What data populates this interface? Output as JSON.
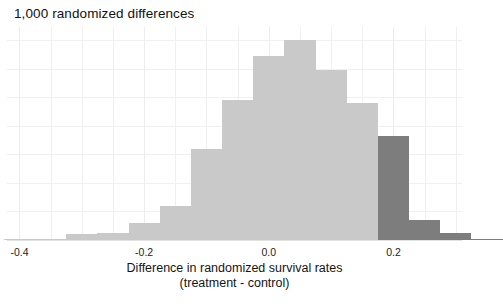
{
  "chart_data": {
    "type": "bar",
    "title": "1,000 randomized differences",
    "subtitle": "",
    "xlabel": "Difference in randomized survival rates",
    "xlabel_line2": "(treatment - control)",
    "ylabel": "",
    "xlim": [
      -0.42,
      0.31
    ],
    "ylim": [
      0,
      150
    ],
    "grid": true,
    "legend": null,
    "xticks": [
      -0.4,
      -0.2,
      0.0,
      0.2
    ],
    "xtick_labels": [
      "-0.4",
      "-0.2",
      "0.0",
      "0.2"
    ],
    "bin_width": 0.05,
    "colors": {
      "bar_light": "#c9c9c9",
      "bar_dark": "#7d7d7d",
      "grid": "#f0f0f0",
      "axis": "#e2e2e2",
      "text": "#1a1a1a"
    },
    "bins": [
      {
        "left": -0.425,
        "right": -0.375,
        "count": 1,
        "highlighted": false
      },
      {
        "left": -0.375,
        "right": -0.325,
        "count": 1,
        "highlighted": false
      },
      {
        "left": -0.325,
        "right": -0.275,
        "count": 4,
        "highlighted": false
      },
      {
        "left": -0.275,
        "right": -0.225,
        "count": 5,
        "highlighted": false
      },
      {
        "left": -0.225,
        "right": -0.175,
        "count": 12,
        "highlighted": false
      },
      {
        "left": -0.175,
        "right": -0.125,
        "count": 24,
        "highlighted": false
      },
      {
        "left": -0.125,
        "right": -0.075,
        "count": 64,
        "highlighted": false
      },
      {
        "left": -0.075,
        "right": -0.025,
        "count": 98,
        "highlighted": false
      },
      {
        "left": -0.025,
        "right": 0.025,
        "count": 129,
        "highlighted": false
      },
      {
        "left": 0.025,
        "right": 0.075,
        "count": 140,
        "highlighted": false
      },
      {
        "left": 0.075,
        "right": 0.125,
        "count": 119,
        "highlighted": false
      },
      {
        "left": 0.125,
        "right": 0.175,
        "count": 96,
        "highlighted": false
      },
      {
        "left": 0.175,
        "right": 0.225,
        "count": 73,
        "highlighted": true
      },
      {
        "left": 0.225,
        "right": 0.275,
        "count": 14,
        "highlighted": true
      },
      {
        "left": 0.275,
        "right": 0.325,
        "count": 5,
        "highlighted": true
      },
      {
        "left": 0.325,
        "right": 0.375,
        "count": 1,
        "highlighted": true
      }
    ],
    "y_gridline_values": [
      0,
      20,
      40,
      60,
      80,
      100,
      120,
      140
    ],
    "x_gridline_values": [
      -0.4,
      -0.35,
      -0.3,
      -0.25,
      -0.2,
      -0.15,
      -0.1,
      -0.05,
      0.0,
      0.05,
      0.1,
      0.15,
      0.2,
      0.25,
      0.3
    ]
  }
}
